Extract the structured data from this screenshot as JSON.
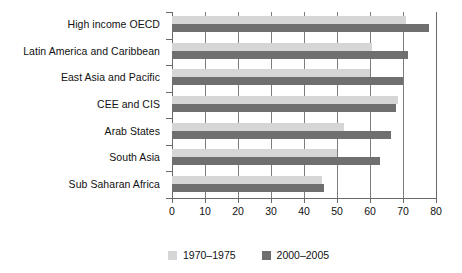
{
  "chart_data": {
    "type": "bar",
    "orientation": "horizontal",
    "title": "",
    "subtitle": "",
    "xlabel": "",
    "ylabel": "",
    "xlim": [
      0,
      80
    ],
    "xticks": [
      0,
      10,
      20,
      30,
      40,
      50,
      60,
      70,
      80
    ],
    "xtick_labels": [
      "0",
      "10",
      "20",
      "30",
      "40",
      "50",
      "60",
      "70",
      "80"
    ],
    "grid": true,
    "grid_axis": "x",
    "legend_position": "bottom",
    "categories": [
      "High income OECD",
      "Latin America and Caribbean",
      "East Asia and Pacific",
      "CEE and CIS",
      "Arab States",
      "South Asia",
      "Sub Saharan Africa"
    ],
    "series": [
      {
        "name": "1970–1975",
        "color": "#d6d6d6",
        "values": [
          71.0,
          60.5,
          60.0,
          68.5,
          52.0,
          50.0,
          45.5
        ]
      },
      {
        "name": "2000–2005",
        "color": "#6f6f6f",
        "values": [
          78.0,
          71.5,
          70.0,
          68.0,
          66.5,
          63.0,
          46.0
        ]
      }
    ]
  },
  "legend": {
    "items": [
      {
        "label": "1970–1975",
        "color": "#d6d6d6"
      },
      {
        "label": "2000–2005",
        "color": "#6f6f6f"
      }
    ]
  },
  "colors": {
    "series_1970_1975": "#d6d6d6",
    "series_2000_2005": "#6f6f6f",
    "axis": "#6a6a6a",
    "grid": "#7d7d7d",
    "text": "#111111",
    "background": "#ffffff"
  }
}
